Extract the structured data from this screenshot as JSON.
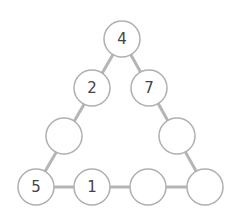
{
  "diagram": {
    "type": "number-triangle-puzzle",
    "colors": {
      "line": "#b5b5b5",
      "circle_stroke": "#b0b0b0",
      "circle_fill": "#ffffff",
      "text": "#444444"
    },
    "nodes": [
      {
        "id": "top",
        "x": 122,
        "y": 39,
        "value": "4"
      },
      {
        "id": "left-2",
        "x": 92,
        "y": 88,
        "value": "2"
      },
      {
        "id": "right-2",
        "x": 149,
        "y": 88,
        "value": "7"
      },
      {
        "id": "left-3",
        "x": 64,
        "y": 136,
        "value": ""
      },
      {
        "id": "right-3",
        "x": 177,
        "y": 136,
        "value": ""
      },
      {
        "id": "bottom-1",
        "x": 36,
        "y": 187,
        "value": "5"
      },
      {
        "id": "bottom-2",
        "x": 92,
        "y": 187,
        "value": "1"
      },
      {
        "id": "bottom-3",
        "x": 148,
        "y": 187,
        "value": ""
      },
      {
        "id": "bottom-4",
        "x": 205,
        "y": 187,
        "value": ""
      }
    ]
  }
}
